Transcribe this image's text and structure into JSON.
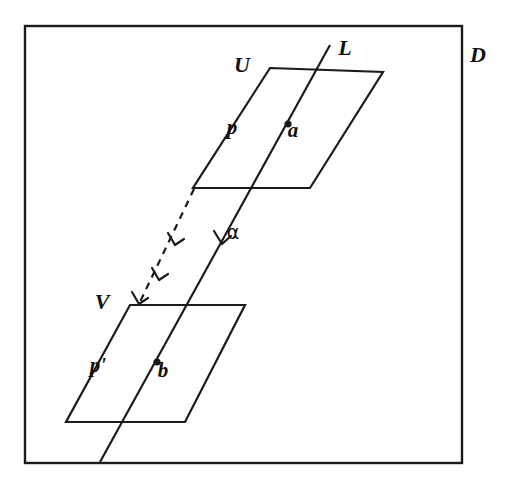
{
  "figure": {
    "title_visible": false,
    "background_color": "#ffffff",
    "ink_color": "#1b1b1b",
    "canvas": {
      "width": 510,
      "height": 489
    },
    "frame": {
      "name": "outer-box",
      "x": 25,
      "y": 26,
      "width": 437,
      "height": 437
    },
    "labels": {
      "domain": "D",
      "line": "L",
      "upper_plane": "U",
      "lower_plane": "V",
      "upper_point_label": "a",
      "lower_point_label": "b",
      "upper_path": "p",
      "lower_path": "p'",
      "prime_mark": "′",
      "map_arrow": "α"
    },
    "label_positions": {
      "domain": {
        "x": 478,
        "y": 62
      },
      "line": {
        "x": 345,
        "y": 55
      },
      "upper_plane": {
        "x": 242,
        "y": 72
      },
      "lower_plane": {
        "x": 102,
        "y": 309
      },
      "upper_point_label": {
        "x": 293,
        "y": 137
      },
      "lower_point_label": {
        "x": 163,
        "y": 377
      },
      "upper_path": {
        "x": 232,
        "y": 134
      },
      "lower_path": {
        "x": 98,
        "y": 372
      },
      "map_arrow": {
        "x": 233,
        "y": 239
      }
    },
    "upper_plane_polygon": [
      {
        "x": 270,
        "y": 68
      },
      {
        "x": 383,
        "y": 72
      },
      {
        "x": 310,
        "y": 188
      },
      {
        "x": 193,
        "y": 188
      }
    ],
    "lower_plane_polygon": [
      {
        "x": 130,
        "y": 305
      },
      {
        "x": 245,
        "y": 305
      },
      {
        "x": 185,
        "y": 422
      },
      {
        "x": 66,
        "y": 422
      }
    ],
    "line_L": {
      "start": {
        "x": 330,
        "y": 45
      },
      "end": {
        "x": 100,
        "y": 462
      },
      "style": "solid",
      "arrow_at": {
        "x": 226,
        "y": 241
      }
    },
    "dashed_arrow": {
      "start": {
        "x": 194,
        "y": 189
      },
      "end": {
        "x": 139,
        "y": 304
      },
      "style": "dashed",
      "arrow_count": 3
    },
    "points": [
      {
        "name": "a",
        "x": 288,
        "y": 124,
        "on": "line_L",
        "plane": "U"
      },
      {
        "name": "b",
        "x": 157,
        "y": 362,
        "on": "line_L",
        "plane": "V"
      }
    ]
  }
}
